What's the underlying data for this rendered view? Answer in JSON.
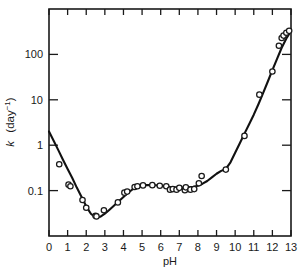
{
  "chart_data": {
    "type": "line",
    "title": "",
    "xlabel": "pH",
    "ylabel": "k  (day⁻¹)",
    "ylabel_symbol": "k",
    "ylabel_units": "(day",
    "ylabel_exp": "−1",
    "ylabel_close": ")",
    "xlim": [
      0,
      13
    ],
    "ylim": [
      0.01,
      1000
    ],
    "yscale": "log",
    "xscale": "linear",
    "grid": false,
    "legend": "none",
    "xticks": [
      0,
      1,
      2,
      3,
      4,
      5,
      6,
      7,
      8,
      9,
      10,
      11,
      12,
      13
    ],
    "xticklabels": [
      "0",
      "1",
      "2",
      "3",
      "4",
      "5",
      "6",
      "7",
      "8",
      "9",
      "10",
      "11",
      "12",
      "13"
    ],
    "yticks": [
      0.1,
      1,
      10,
      100
    ],
    "yticklabels": [
      "0.1",
      "1",
      "10",
      "100"
    ],
    "marker": "open-circle",
    "series": [
      {
        "name": "measured rate constant",
        "x": [
          0.55,
          1.05,
          1.15,
          1.8,
          2.0,
          2.5,
          2.55,
          2.95,
          3.7,
          4.05,
          4.2,
          4.6,
          4.75,
          5.05,
          5.55,
          5.95,
          6.3,
          6.5,
          6.65,
          6.85,
          7.0,
          7.3,
          7.35,
          7.6,
          7.8,
          8.05,
          8.2,
          9.5,
          10.5,
          11.3,
          12.0,
          12.35,
          12.5,
          12.6,
          12.75,
          12.9
        ],
        "y": [
          0.38,
          0.135,
          0.125,
          0.062,
          0.042,
          0.028,
          0.027,
          0.037,
          0.055,
          0.09,
          0.095,
          0.12,
          0.125,
          0.13,
          0.132,
          0.128,
          0.125,
          0.105,
          0.108,
          0.105,
          0.115,
          0.102,
          0.118,
          0.105,
          0.108,
          0.145,
          0.21,
          0.29,
          1.6,
          13.0,
          42.0,
          155.0,
          230.0,
          260.0,
          300.0,
          330.0
        ]
      }
    ],
    "fit_curve": {
      "name": "fitted pH-rate profile",
      "x": [
        0.0,
        0.25,
        0.5,
        0.75,
        1.0,
        1.25,
        1.5,
        1.75,
        2.0,
        2.25,
        2.5,
        2.75,
        3.0,
        3.25,
        3.5,
        3.75,
        4.0,
        4.25,
        4.5,
        4.75,
        5.0,
        5.25,
        5.5,
        5.75,
        6.0,
        6.25,
        6.5,
        6.75,
        7.0,
        7.25,
        7.5,
        7.75,
        8.0,
        8.25,
        8.5,
        8.75,
        9.0,
        9.25,
        9.5,
        9.75,
        10.0,
        10.25,
        10.5,
        10.75,
        11.0,
        11.25,
        11.5,
        11.75,
        12.0,
        12.25,
        12.5,
        12.75,
        13.0
      ],
      "y": [
        2.0,
        1.25,
        0.78,
        0.48,
        0.3,
        0.19,
        0.115,
        0.072,
        0.045,
        0.031,
        0.0255,
        0.0265,
        0.031,
        0.038,
        0.047,
        0.058,
        0.072,
        0.09,
        0.107,
        0.12,
        0.128,
        0.132,
        0.133,
        0.131,
        0.128,
        0.124,
        0.12,
        0.118,
        0.117,
        0.117,
        0.118,
        0.121,
        0.128,
        0.142,
        0.163,
        0.195,
        0.235,
        0.272,
        0.3,
        0.42,
        0.68,
        1.1,
        1.8,
        2.9,
        4.7,
        8.0,
        14.0,
        25.0,
        45.0,
        80.0,
        140.0,
        225.0,
        330.0
      ]
    }
  },
  "figure": {
    "background_color": "#ffffff",
    "line_color": "#111111",
    "marker_fill": "#ffffff"
  }
}
